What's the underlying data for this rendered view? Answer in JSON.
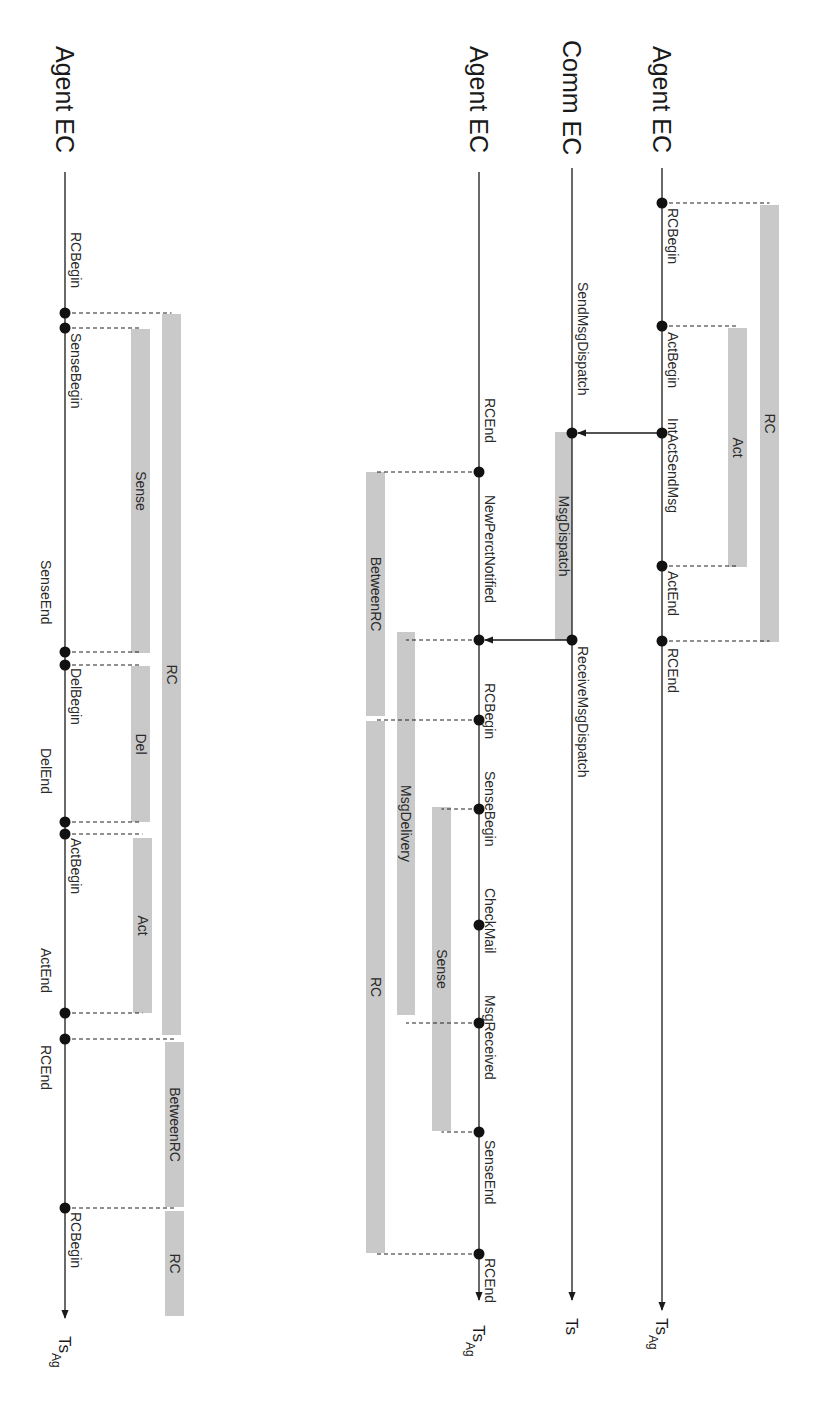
{
  "colors": {
    "bar": "#c9c9c9",
    "line": "#1a1a1a",
    "text": "#2a2a2a",
    "background": "#ffffff"
  },
  "timelines": [
    {
      "id": "agent-ec-top",
      "title": "Agent EC",
      "axis_label": "Ts",
      "axis_sub": "Ag",
      "x": 662,
      "y_start": 168,
      "y_end": 1310,
      "title_y": 46,
      "ts_y": 1318,
      "events": [
        {
          "label": "RCBegin",
          "y": 203,
          "label_y": 208,
          "side": "right"
        },
        {
          "label": "ActBegin",
          "y": 326,
          "label_y": 332,
          "side": "right"
        },
        {
          "label": "IntActSendMsg",
          "y": 433,
          "label_y": 418,
          "side": "right"
        },
        {
          "label": "ActEnd",
          "y": 566,
          "label_y": 571,
          "side": "right"
        },
        {
          "label": "RCEnd",
          "y": 641,
          "label_y": 648,
          "side": "right"
        }
      ],
      "bars": [
        {
          "label": "RC",
          "x": 760,
          "width": 19,
          "y1": 205,
          "y2": 642,
          "from_event_y": [
            203,
            641
          ]
        },
        {
          "label": "Act",
          "x": 728,
          "width": 19,
          "y1": 328,
          "y2": 567,
          "from_event_y": [
            326,
            566
          ]
        }
      ]
    },
    {
      "id": "comm-ec",
      "title": "Comm EC",
      "axis_label": "Ts",
      "axis_sub": "",
      "x": 572,
      "y_start": 168,
      "y_end": 1300,
      "title_y": 40,
      "ts_y": 1318,
      "events": [
        {
          "label": "SendMsgDispatch",
          "y": 433,
          "label_y": 282,
          "side": "right"
        },
        {
          "label": "ReceiveMsgDispatch",
          "y": 640,
          "label_y": 646,
          "side": "right"
        }
      ],
      "bars": [
        {
          "label": "MsgDispatch",
          "x": 555,
          "width": 17,
          "y1": 432,
          "y2": 640,
          "from_event_y": []
        }
      ]
    },
    {
      "id": "agent-ec-middle",
      "title": "Agent EC",
      "axis_label": "Ts",
      "axis_sub": "Ag",
      "x": 479,
      "y_start": 172,
      "y_end": 1300,
      "title_y": 46,
      "ts_y": 1325,
      "events": [
        {
          "label": "RCEnd",
          "y": 472,
          "label_y": 398,
          "side": "right"
        },
        {
          "label": "NewPerctNotified",
          "y": 640,
          "label_y": 495,
          "side": "right"
        },
        {
          "label": "RCBegin",
          "y": 720,
          "label_y": 683,
          "side": "right"
        },
        {
          "label": "SenseBegin",
          "y": 809,
          "label_y": 771,
          "side": "right"
        },
        {
          "label": "CheckMail",
          "y": 925,
          "label_y": 888,
          "side": "right"
        },
        {
          "label": "MsgReceived",
          "y": 1023,
          "label_y": 995,
          "side": "right"
        },
        {
          "label": "SenseEnd",
          "y": 1132,
          "label_y": 1140,
          "side": "right"
        },
        {
          "label": "RCEnd",
          "y": 1254,
          "label_y": 1258,
          "side": "right"
        }
      ],
      "bars": [
        {
          "label": "BetweenRC",
          "x": 366,
          "width": 19,
          "y1": 472,
          "y2": 716,
          "from_event_y": [
            472
          ]
        },
        {
          "label": "RC",
          "x": 366,
          "width": 19,
          "y1": 721,
          "y2": 1253,
          "from_event_y": [
            720,
            1254
          ]
        },
        {
          "label": "MsgDelivery",
          "x": 397,
          "width": 18,
          "y1": 632,
          "y2": 1015,
          "from_event_y": [
            640,
            1023
          ]
        },
        {
          "label": "Sense",
          "x": 432,
          "width": 19,
          "y1": 807,
          "y2": 1131,
          "from_event_y": [
            809,
            1132
          ]
        }
      ]
    },
    {
      "id": "agent-ec-left",
      "title": "Agent EC",
      "axis_label": "Ts",
      "axis_sub": "Ag",
      "x": 65,
      "y_start": 172,
      "y_end": 1318,
      "title_y": 46,
      "ts_y": 1336,
      "events": [
        {
          "label": "RCBegin",
          "y": 313,
          "label_y": 232,
          "side": "right"
        },
        {
          "label": "SenseBegin",
          "y": 328,
          "label_y": 333,
          "side": "right"
        },
        {
          "label": "SenseEnd",
          "y": 652,
          "label_y": 560,
          "side": "left"
        },
        {
          "label": "DelBegin",
          "y": 665,
          "label_y": 668,
          "side": "right"
        },
        {
          "label": "DelEnd",
          "y": 822,
          "label_y": 748,
          "side": "left"
        },
        {
          "label": "ActBegin",
          "y": 834,
          "label_y": 838,
          "side": "right"
        },
        {
          "label": "ActEnd",
          "y": 1013,
          "label_y": 948,
          "side": "left"
        },
        {
          "label": "RCEnd",
          "y": 1039,
          "label_y": 1045,
          "side": "left"
        },
        {
          "label": "RCBegin",
          "y": 1208,
          "label_y": 1212,
          "side": "right"
        }
      ],
      "bars": [
        {
          "label": "RC",
          "x": 162,
          "width": 19,
          "y1": 314,
          "y2": 1035,
          "from_event_y": [
            313
          ]
        },
        {
          "label": "Sense",
          "x": 131,
          "width": 19,
          "y1": 329,
          "y2": 653,
          "from_event_y": [
            328,
            652
          ]
        },
        {
          "label": "Del",
          "x": 131,
          "width": 19,
          "y1": 666,
          "y2": 822,
          "from_event_y": [
            665,
            822
          ]
        },
        {
          "label": "Act",
          "x": 133,
          "width": 19,
          "y1": 838,
          "y2": 1013,
          "from_event_y": [
            834,
            1013
          ]
        },
        {
          "label": "BetweenRC",
          "x": 165,
          "width": 19,
          "y1": 1042,
          "y2": 1207,
          "from_event_y": [
            1039
          ]
        },
        {
          "label": "RC",
          "x": 165,
          "width": 19,
          "y1": 1211,
          "y2": 1316,
          "from_event_y": [
            1208
          ]
        }
      ]
    }
  ],
  "messages": [
    {
      "from_x": 662,
      "to_x": 572,
      "y": 433,
      "label": "IntActSendMsg to SendMsgDispatch"
    },
    {
      "from_x": 572,
      "to_x": 479,
      "y": 640,
      "label": "ReceiveMsgDispatch to NewPerctNotified"
    }
  ]
}
